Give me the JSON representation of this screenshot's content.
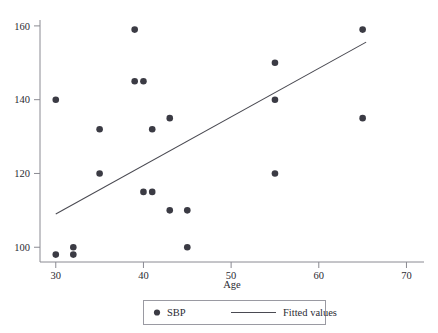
{
  "chart_data": {
    "type": "scatter",
    "title": "",
    "xlabel": "Age",
    "ylabel": "",
    "xlim": [
      28.2,
      72.0
    ],
    "ylim": [
      96.0,
      161.6
    ],
    "xticks": [
      30,
      40,
      50,
      60,
      70
    ],
    "yticks": [
      100,
      120,
      140,
      160
    ],
    "xtick_labels": [
      "30",
      "40",
      "50",
      "60",
      "70"
    ],
    "ytick_labels": [
      "100",
      "120",
      "140",
      "160"
    ],
    "grid": false,
    "legend_position": "below-center",
    "series": [
      {
        "name": "SBP",
        "type": "scatter",
        "marker": "circle",
        "color": "#3b3b44",
        "points": [
          {
            "x": 30,
            "y": 140
          },
          {
            "x": 30,
            "y": 98
          },
          {
            "x": 32,
            "y": 100
          },
          {
            "x": 32,
            "y": 98
          },
          {
            "x": 35,
            "y": 132
          },
          {
            "x": 35,
            "y": 120
          },
          {
            "x": 39,
            "y": 159
          },
          {
            "x": 39,
            "y": 145
          },
          {
            "x": 40,
            "y": 145
          },
          {
            "x": 40,
            "y": 115
          },
          {
            "x": 41,
            "y": 132
          },
          {
            "x": 41,
            "y": 115
          },
          {
            "x": 43,
            "y": 135
          },
          {
            "x": 43,
            "y": 110
          },
          {
            "x": 45,
            "y": 110
          },
          {
            "x": 45,
            "y": 100
          },
          {
            "x": 55,
            "y": 150
          },
          {
            "x": 55,
            "y": 140
          },
          {
            "x": 55,
            "y": 120
          },
          {
            "x": 65,
            "y": 159
          },
          {
            "x": 65,
            "y": 135
          }
        ]
      },
      {
        "name": "Fitted values",
        "type": "line",
        "color": "#4a4a52",
        "endpoints": [
          {
            "x": 30,
            "y": 109
          },
          {
            "x": 65.4,
            "y": 155.6
          }
        ]
      }
    ],
    "legend_entries": [
      {
        "label": "SBP",
        "glyph": "circle-marker"
      },
      {
        "label": "Fitted values",
        "glyph": "line-segment"
      }
    ],
    "colors": {
      "marker": "#3b3b44",
      "line": "#4a4a52",
      "axis": "#8a8a92",
      "text": "#2b2b33",
      "legend_border": "#9a9aa2",
      "background": "#ffffff"
    }
  }
}
